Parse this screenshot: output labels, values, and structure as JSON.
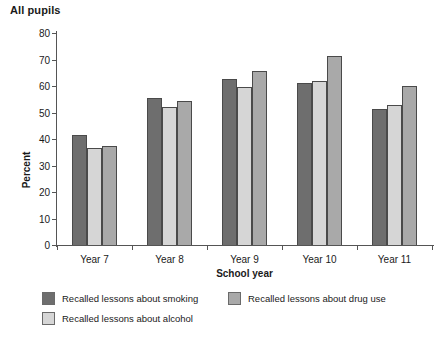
{
  "chart_data": {
    "type": "bar",
    "title": "All pupils",
    "xlabel": "School year",
    "ylabel": "Percent",
    "ylim": [
      0,
      80
    ],
    "yticks": [
      0,
      10,
      20,
      30,
      40,
      50,
      60,
      70,
      80
    ],
    "grid": false,
    "legend_position": "bottom-left",
    "categories": [
      "Year 7",
      "Year 8",
      "Year 9",
      "Year 10",
      "Year 11"
    ],
    "series": [
      {
        "name": "Recalled lessons about smoking",
        "color": "#6e6e6e",
        "values": [
          41.5,
          55.5,
          62.5,
          61.0,
          51.5
        ]
      },
      {
        "name": "Recalled lessons about alcohol",
        "color": "#d6d6d6",
        "values": [
          36.5,
          52.0,
          59.5,
          62.0,
          53.0
        ]
      },
      {
        "name": "Recalled lessons about drug use",
        "color": "#a9a9a9",
        "values": [
          37.5,
          54.5,
          65.5,
          71.5,
          60.0
        ]
      }
    ],
    "legend_layout": {
      "row1": [
        "Recalled lessons about smoking",
        "Recalled lessons about drug use"
      ],
      "row2": [
        "Recalled lessons about alcohol"
      ]
    }
  }
}
